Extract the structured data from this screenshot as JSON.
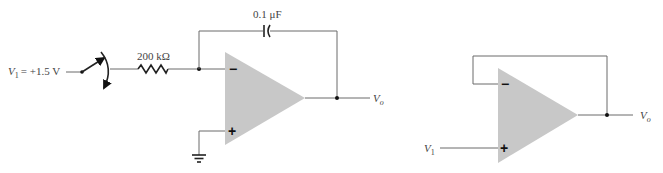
{
  "figure": {
    "left_circuit": {
      "name": "integrator",
      "input_label_var": "V",
      "input_label_sub": "1",
      "input_label_value": "= +1.5 V",
      "resistor_label": "200 kΩ",
      "capacitor_label": "0.1 μF",
      "output_label_var": "V",
      "output_label_sub": "o",
      "inverting_sign": "−",
      "noninverting_sign": "+",
      "components": [
        "switch",
        "resistor",
        "capacitor",
        "op-amp",
        "ground"
      ]
    },
    "right_circuit": {
      "name": "voltage-follower",
      "input_label_var": "V",
      "input_label_sub": "1",
      "output_label_var": "V",
      "output_label_sub": "o",
      "inverting_sign": "−",
      "noninverting_sign": "+",
      "components": [
        "op-amp",
        "unity-feedback-wire"
      ]
    },
    "colors": {
      "opamp_fill": "#c8c8c8",
      "wire": "#6a6a6a",
      "text": "#444444"
    }
  }
}
